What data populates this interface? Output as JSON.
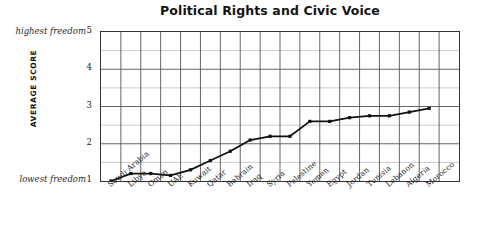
{
  "chart_data": {
    "type": "line",
    "title": "Political Rights and Civic Voice",
    "xlabel": "",
    "ylabel": "AVERAGE SCORE",
    "ylim": [
      1,
      5
    ],
    "y_ticks": [
      1,
      2,
      3,
      4,
      5
    ],
    "grid": true,
    "legend": "none",
    "annotations": {
      "y_max_note": "highest freedom",
      "y_min_note": "lowest freedom"
    },
    "categories": [
      "Saudi Arabia",
      "Libya",
      "Oman",
      "UAE",
      "Kuwait",
      "Qatar",
      "Bahrain",
      "Iraq",
      "Syria",
      "Palestine",
      "Yemen",
      "Egypt",
      "Jordan",
      "Tunisia",
      "Lebanon",
      "Algeria",
      "Morocco"
    ],
    "values": [
      1.0,
      1.2,
      1.2,
      1.15,
      1.3,
      1.55,
      1.8,
      2.1,
      2.2,
      2.2,
      2.6,
      2.6,
      2.7,
      2.75,
      2.75,
      2.85,
      2.95
    ],
    "series_name": "Average score",
    "marker": "square",
    "line_color": "#111111",
    "grid_color": "#8a8a8a",
    "axis_color": "#333333"
  }
}
